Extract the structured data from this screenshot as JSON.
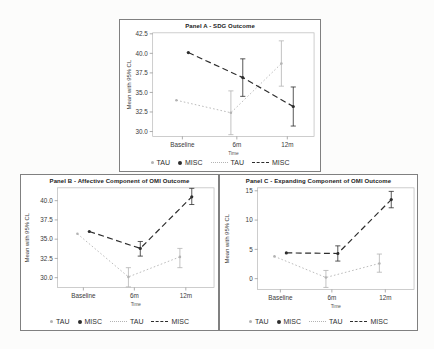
{
  "figure": {
    "legend": {
      "tau_marker_label": "TAU",
      "misc_marker_label": "MISC",
      "tau_line_label": "TAU",
      "misc_line_label": "MISC"
    },
    "colors": {
      "tau": "#b3b3b3",
      "misc": "#2d2d2d"
    }
  },
  "chart_data": [
    {
      "type": "line",
      "title": "Panel A - SDG Outcome",
      "xlabel": "Time",
      "ylabel": "Mean with 95% CL",
      "categories": [
        "Baseline",
        "6m",
        "12m"
      ],
      "yticks": [
        30.0,
        32.5,
        35.0,
        37.5,
        40.0,
        42.5
      ],
      "ytick_labels": [
        "30.0",
        "32.5",
        "35.0",
        "37.5",
        "40.0",
        "42.5"
      ],
      "ylim": [
        29.4,
        42.6
      ],
      "grid": false,
      "legend_position": "bottom",
      "series": [
        {
          "name": "TAU",
          "style": "dotted",
          "color": "#b3b3b3",
          "values": [
            34.0,
            32.4,
            38.7
          ],
          "ci_low": [
            null,
            29.6,
            35.8
          ],
          "ci_high": [
            null,
            35.2,
            41.6
          ]
        },
        {
          "name": "MISC",
          "style": "dashed",
          "color": "#2d2d2d",
          "values": [
            40.1,
            36.9,
            33.2
          ],
          "ci_low": [
            null,
            34.5,
            30.7
          ],
          "ci_high": [
            null,
            39.3,
            35.7
          ]
        }
      ]
    },
    {
      "type": "line",
      "title": "Panel B - Affective Component of OMI Outcome",
      "xlabel": "Time",
      "ylabel": "Mean with 95% CL",
      "categories": [
        "Baseline",
        "6m",
        "12m"
      ],
      "yticks": [
        30.0,
        32.5,
        35.0,
        37.5,
        40.0
      ],
      "ytick_labels": [
        "30.0",
        "32.5",
        "35.0",
        "37.5",
        "40.0"
      ],
      "ylim": [
        28.6,
        41.8
      ],
      "grid": false,
      "legend_position": "bottom",
      "series": [
        {
          "name": "TAU",
          "style": "dotted",
          "color": "#b3b3b3",
          "values": [
            35.7,
            30.1,
            32.7
          ],
          "ci_low": [
            null,
            28.8,
            31.3
          ],
          "ci_high": [
            null,
            31.3,
            33.8
          ]
        },
        {
          "name": "MISC",
          "style": "dashed",
          "color": "#2d2d2d",
          "values": [
            36.0,
            33.8,
            40.5
          ],
          "ci_low": [
            null,
            32.8,
            39.5
          ],
          "ci_high": [
            null,
            34.7,
            41.6
          ]
        }
      ]
    },
    {
      "type": "line",
      "title": "Panel C - Expanding Component of OMI Outcome",
      "xlabel": "Time",
      "ylabel": "Mean with 95% CL",
      "categories": [
        "Baseline",
        "6m",
        "12m"
      ],
      "yticks": [
        0,
        5,
        10,
        15
      ],
      "ytick_labels": [
        "0",
        "5",
        "10",
        "15"
      ],
      "ylim": [
        -1.9,
        15.5
      ],
      "grid": false,
      "legend_position": "bottom",
      "series": [
        {
          "name": "TAU",
          "style": "dotted",
          "color": "#b3b3b3",
          "values": [
            3.8,
            0.2,
            2.6
          ],
          "ci_low": [
            null,
            -1.5,
            1.1
          ],
          "ci_high": [
            null,
            1.4,
            4.2
          ]
        },
        {
          "name": "MISC",
          "style": "dashed",
          "color": "#2d2d2d",
          "values": [
            4.4,
            4.3,
            13.5
          ],
          "ci_low": [
            null,
            3.0,
            12.1
          ],
          "ci_high": [
            null,
            5.6,
            14.9
          ]
        }
      ]
    }
  ]
}
